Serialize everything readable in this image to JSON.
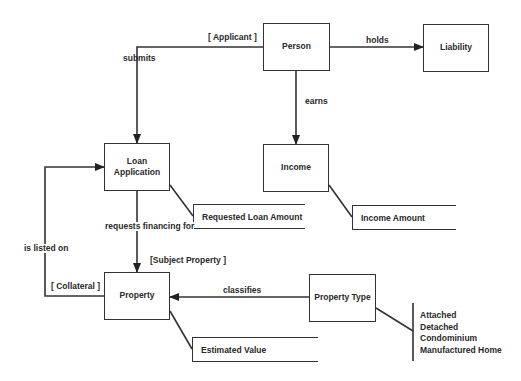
{
  "diagram": {
    "type": "entity-relationship",
    "entities": [
      {
        "id": "person",
        "label": "Person"
      },
      {
        "id": "liability",
        "label": "Liability"
      },
      {
        "id": "loan_application",
        "label": "Loan\nApplication",
        "line1": "Loan",
        "line2": "Application"
      },
      {
        "id": "income",
        "label": "Income"
      },
      {
        "id": "property",
        "label": "Property"
      },
      {
        "id": "property_type",
        "label": "Property Type"
      }
    ],
    "attributes": [
      {
        "entity": "loan_application",
        "label": "Requested Loan Amount"
      },
      {
        "entity": "income",
        "label": "Income Amount"
      },
      {
        "entity": "property",
        "label": "Estimated Value"
      }
    ],
    "relationships": [
      {
        "from": "person",
        "to": "loan_application",
        "label": "submits",
        "role": "[ Applicant ]"
      },
      {
        "from": "person",
        "to": "liability",
        "label": "holds"
      },
      {
        "from": "person",
        "to": "income",
        "label": "earns"
      },
      {
        "from": "loan_application",
        "to": "property",
        "label": "requests financing for",
        "role": "[Subject Property ]"
      },
      {
        "from": "property",
        "to": "loan_application",
        "label": "is listed on",
        "role": "[ Collateral ]"
      },
      {
        "from": "property_type",
        "to": "property",
        "label": "classifies"
      }
    ],
    "enumeration": {
      "entity": "property_type",
      "values": [
        "Attached",
        "Detached",
        "Condominium",
        "Manufactured Home"
      ]
    }
  }
}
